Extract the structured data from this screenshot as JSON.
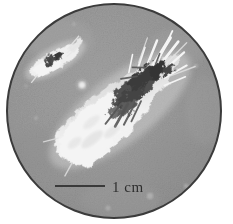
{
  "figure": {
    "background_color": "#ffffff",
    "field": {
      "shape": "circle",
      "center_x": 114,
      "center_y": 111,
      "radius": 108,
      "fill_color": "#999999",
      "border_color": "#3b3b3b",
      "border_width": 2
    },
    "scalebar": {
      "label": "1 cm",
      "line_color": "#3a3a3a",
      "x_start": 55,
      "x_end": 105,
      "y": 186,
      "thickness": 2,
      "label_x": 112,
      "label_y": 192
    },
    "specimens": [
      {
        "name": "large-specimen",
        "description": "Large elongated bright specimen with dark mottled core, oriented lower-left to upper-right",
        "center_x": 120,
        "center_y": 110,
        "angle_deg": -38,
        "length": 150,
        "width": 52,
        "bright_color": "#fdfdfd",
        "core_color": "#3d3d3d"
      },
      {
        "name": "small-specimen",
        "description": "Small elongated bright specimen with dark core at upper left",
        "center_x": 55,
        "center_y": 60,
        "angle_deg": -30,
        "length": 58,
        "width": 20,
        "bright_color": "#f6f6f6",
        "core_color": "#454545"
      },
      {
        "name": "bright-speck",
        "description": "Small isolated bright dot near center-left",
        "center_x": 82,
        "center_y": 85,
        "radius": 5,
        "bright_color": "#efefef"
      }
    ],
    "palette": {
      "background": "#ffffff",
      "field_gray": "#999999",
      "field_gray_light": "#a6a6a6",
      "field_gray_dark": "#8c8c8c",
      "specimen_bright": "#fdfdfd",
      "specimen_dark": "#3d3d3d",
      "outline": "#3b3b3b",
      "text": "#2e2e2e"
    }
  }
}
